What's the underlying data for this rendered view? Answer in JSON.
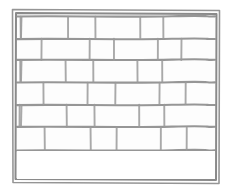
{
  "figure": {
    "kind": "line-drawing",
    "title": "",
    "caption": "",
    "background_color": "#ffffff",
    "ink_color": "#8d8d8d",
    "frame_color": "#8a8a8a",
    "width_px": 231,
    "height_px": 196
  },
  "frame": {
    "outer": {
      "x": 12,
      "y": 9,
      "width": 208,
      "height": 175
    },
    "inner": {
      "x": 16,
      "y": 13,
      "width": 200,
      "height": 167
    },
    "note": "double-stroke rectangular border, hand-drawn"
  },
  "wall": {
    "bond": "running-bond",
    "course_count": 6,
    "empty_band": {
      "y_top": 150,
      "y_bottom": 180,
      "description": "blank strip below lowest brick course"
    },
    "courses": [
      {
        "index": 1,
        "y_top": 16,
        "y_bottom": 38,
        "joint_x": [
          16,
          20,
          68,
          95,
          140,
          163,
          216
        ]
      },
      {
        "index": 2,
        "y_top": 38,
        "y_bottom": 60,
        "joint_x": [
          16,
          42,
          90,
          114,
          158,
          182,
          216
        ]
      },
      {
        "index": 3,
        "y_top": 60,
        "y_bottom": 82,
        "joint_x": [
          16,
          20,
          65,
          93,
          137,
          162,
          216
        ]
      },
      {
        "index": 4,
        "y_top": 82,
        "y_bottom": 104,
        "joint_x": [
          16,
          43,
          88,
          116,
          160,
          186,
          216
        ]
      },
      {
        "index": 5,
        "y_top": 104,
        "y_bottom": 127,
        "joint_x": [
          16,
          20,
          66,
          94,
          139,
          164,
          216
        ]
      },
      {
        "index": 6,
        "y_top": 127,
        "y_bottom": 150,
        "joint_x": [
          16,
          44,
          90,
          117,
          161,
          187,
          216
        ]
      }
    ]
  },
  "labels": {
    "figure_label": "",
    "annotations": []
  }
}
